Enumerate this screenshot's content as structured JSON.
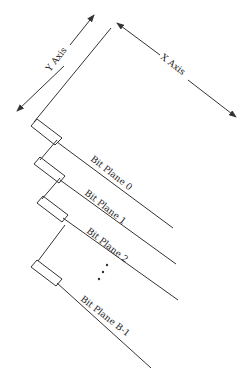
{
  "diagram": {
    "axes": {
      "y_label": "Y Axis",
      "x_label": "X Axis"
    },
    "planes": [
      {
        "label": "Bit Plane 0"
      },
      {
        "label": "Bit Plane 1"
      },
      {
        "label": "Bit Plane 2"
      },
      {
        "label": "Bit Plane B-1"
      }
    ],
    "ellipsis": "⋮",
    "colors": {
      "line": "#333333",
      "background": "#ffffff"
    }
  }
}
